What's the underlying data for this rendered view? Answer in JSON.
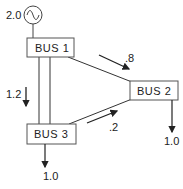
{
  "diagram": {
    "generator": {
      "label": "2.0"
    },
    "buses": [
      {
        "label": "BUS 1"
      },
      {
        "label": "BUS 2"
      },
      {
        "label": "BUS 3"
      }
    ],
    "flows": {
      "bus1_to_bus3": "1.2",
      "bus1_to_bus2": ".8",
      "bus3_to_bus2": ".2"
    },
    "loads": {
      "bus2": "1.0",
      "bus3": "1.0"
    }
  }
}
